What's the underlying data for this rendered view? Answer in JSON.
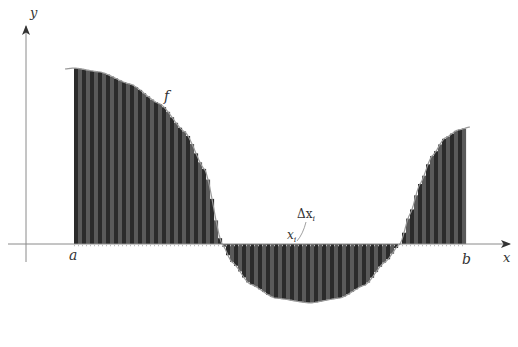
{
  "figure": {
    "type": "riemann_sum_diagram",
    "labels": {
      "y_axis": "y",
      "x_axis": "x",
      "function": "f",
      "a": "a",
      "b": "b",
      "delta_x": "Δx",
      "delta_x_sub": "i",
      "x_i": "x",
      "x_i_sub": "i"
    },
    "colors": {
      "bar_dark": "#2b2b2b",
      "bar_light": "#5a5a5a",
      "curve": "#9a9a9a",
      "axis": "#8a8a8a",
      "background": "#ffffff"
    },
    "geometry": {
      "x_axis_y": 244,
      "y_axis_x": 26,
      "a_px": 74,
      "b_px": 466,
      "num_rectangles": 98
    }
  }
}
